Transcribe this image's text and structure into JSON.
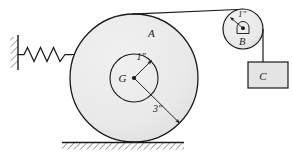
{
  "figure": {
    "colors": {
      "body_fill": "#e9e9e9",
      "block_fill": "#e3e3e3",
      "stroke": "#1a1a1a",
      "hatch": "#4a4a4a",
      "background": "#ffffff"
    }
  },
  "labels": {
    "wheel_a": "A",
    "pulley_b": "B",
    "block_c": "C",
    "center_g": "G",
    "hub_radius": "1″",
    "outer_radius": "3″",
    "pulley_radius": "1″"
  },
  "components": {
    "wall": {
      "name": "fixed-wall",
      "hatched": true
    },
    "spring": {
      "name": "spring",
      "coils": 4
    },
    "ground": {
      "name": "ground-surface",
      "hatched": true
    },
    "cord_top": {
      "name": "cord-wheel-to-pulley"
    },
    "cord_drop": {
      "name": "cord-pulley-to-block"
    },
    "cord_spring": {
      "name": "cord-spring-to-hub"
    }
  },
  "geometry": {
    "wheel_a": {
      "cx": 134,
      "cy": 78,
      "r": 64
    },
    "hub": {
      "cx": 134,
      "cy": 78,
      "r": 24
    },
    "pulley_b": {
      "cx": 243,
      "cy": 29,
      "r": 20
    },
    "block_c": {
      "x": 248,
      "y": 62,
      "w": 40,
      "h": 26
    }
  }
}
